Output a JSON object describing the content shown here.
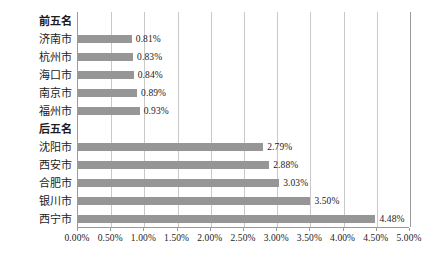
{
  "chart_data": {
    "type": "bar",
    "orientation": "horizontal",
    "title": "",
    "xlabel": "",
    "ylabel": "",
    "xlim": [
      0,
      0.05
    ],
    "grid": true,
    "legend": false,
    "bar_color": "#969696",
    "gridline_color": "#c9c9c9",
    "axis_color": "#9a9a9a",
    "background": "#ffffff",
    "xticks": [
      "0.00%",
      "0.50%",
      "1.00%",
      "1.50%",
      "2.00%",
      "2.50%",
      "3.00%",
      "3.50%",
      "4.00%",
      "4.50%",
      "5.00%"
    ],
    "xtick_values": [
      0,
      0.005,
      0.01,
      0.015,
      0.02,
      0.025,
      0.03,
      0.035,
      0.04,
      0.045,
      0.05
    ],
    "categories": [
      "前五名",
      "济南市",
      "杭州市",
      "海口市",
      "南京市",
      "福州市",
      "后五名",
      "沈阳市",
      "西安市",
      "合肥市",
      "银川市",
      "西宁市"
    ],
    "rows": [
      {
        "category": "前五名",
        "is_header": true,
        "value": null,
        "label": ""
      },
      {
        "category": "济南市",
        "is_header": false,
        "value": 0.0081,
        "label": "0.81%"
      },
      {
        "category": "杭州市",
        "is_header": false,
        "value": 0.0083,
        "label": "0.83%"
      },
      {
        "category": "海口市",
        "is_header": false,
        "value": 0.0084,
        "label": "0.84%"
      },
      {
        "category": "南京市",
        "is_header": false,
        "value": 0.0089,
        "label": "0.89%"
      },
      {
        "category": "福州市",
        "is_header": false,
        "value": 0.0093,
        "label": "0.93%"
      },
      {
        "category": "后五名",
        "is_header": true,
        "value": null,
        "label": ""
      },
      {
        "category": "沈阳市",
        "is_header": false,
        "value": 0.0279,
        "label": "2.79%"
      },
      {
        "category": "西安市",
        "is_header": false,
        "value": 0.0288,
        "label": "2.88%"
      },
      {
        "category": "合肥市",
        "is_header": false,
        "value": 0.0303,
        "label": "3.03%"
      },
      {
        "category": "银川市",
        "is_header": false,
        "value": 0.035,
        "label": "3.50%"
      },
      {
        "category": "西宁市",
        "is_header": false,
        "value": 0.0448,
        "label": "4.48%"
      }
    ],
    "values": [
      null,
      0.0081,
      0.0083,
      0.0084,
      0.0089,
      0.0093,
      null,
      0.0279,
      0.0288,
      0.0303,
      0.035,
      0.0448
    ]
  }
}
